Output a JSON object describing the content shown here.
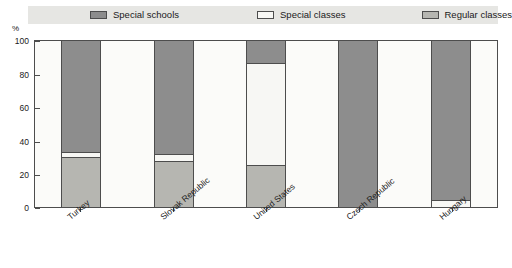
{
  "legend": {
    "items": [
      {
        "label": "Special schools",
        "color": "#8d8d8d"
      },
      {
        "label": "Special classes",
        "color": "#f7f7f4"
      },
      {
        "label": "Regular classes",
        "color": "#b6b6b1"
      }
    ]
  },
  "axis": {
    "y_unit": "%",
    "y_ticks": [
      "100",
      "80",
      "60",
      "40",
      "20",
      "0"
    ]
  },
  "chart_data": {
    "type": "bar",
    "title": "",
    "subtitle": "",
    "xlabel": "",
    "ylabel": "%",
    "ylim": [
      0,
      100
    ],
    "grid": false,
    "stacked": true,
    "stack_total": 100,
    "legend_position": "top",
    "categories": [
      "Turkey",
      "Slovak Republic",
      "United States",
      "Czech Republic",
      "Hungary"
    ],
    "series": [
      {
        "name": "Special schools",
        "color": "#8d8d8d",
        "values": [
          67,
          68,
          13,
          100,
          96
        ]
      },
      {
        "name": "Special classes",
        "color": "#f7f7f4",
        "values": [
          3,
          4,
          62,
          0,
          4
        ]
      },
      {
        "name": "Regular classes",
        "color": "#b6b6b1",
        "values": [
          30,
          28,
          25,
          0,
          0
        ]
      }
    ]
  }
}
